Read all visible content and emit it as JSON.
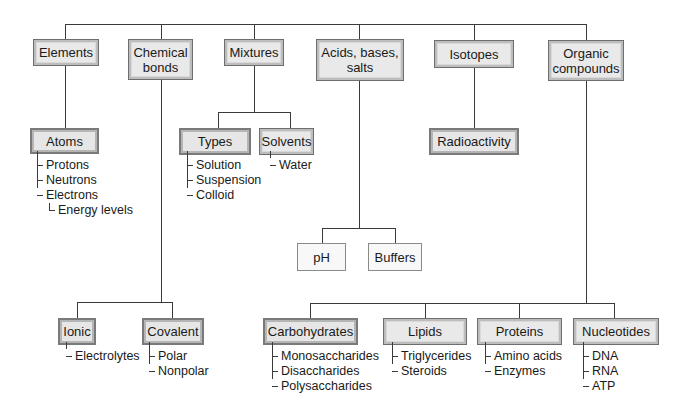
{
  "diagram": {
    "type": "concept-map",
    "top_level": [
      {
        "id": "elements",
        "label": "Elements"
      },
      {
        "id": "chemical_bonds",
        "label": "Chemical bonds"
      },
      {
        "id": "mixtures",
        "label": "Mixtures"
      },
      {
        "id": "acids_bases_salts",
        "label": "Acids, bases, salts"
      },
      {
        "id": "isotopes",
        "label": "Isotopes"
      },
      {
        "id": "organic_compounds",
        "label": "Organic compounds"
      }
    ],
    "nodes": {
      "elements": {
        "label": "Elements"
      },
      "chemical_bonds": {
        "label_line1": "Chemical",
        "label_line2": "bonds"
      },
      "mixtures": {
        "label": "Mixtures"
      },
      "acids_bases_salts": {
        "label_line1": "Acids, bases,",
        "label_line2": "salts"
      },
      "isotopes": {
        "label": "Isotopes"
      },
      "organic_compounds": {
        "label_line1": "Organic",
        "label_line2": "compounds"
      },
      "atoms": {
        "label": "Atoms",
        "items": [
          "Protons",
          "Neutrons",
          "Electrons"
        ],
        "sub_items": [
          "Energy levels"
        ]
      },
      "types": {
        "label": "Types",
        "items": [
          "Solution",
          "Suspension",
          "Colloid"
        ]
      },
      "solvents": {
        "label": "Solvents",
        "items": [
          "Water"
        ]
      },
      "radioactivity": {
        "label": "Radioactivity"
      },
      "ph": {
        "label": "pH"
      },
      "buffers": {
        "label": "Buffers"
      },
      "ionic": {
        "label": "Ionic",
        "items": [
          "Electrolytes"
        ]
      },
      "covalent": {
        "label": "Covalent",
        "items": [
          "Polar",
          "Nonpolar"
        ]
      },
      "carbohydrates": {
        "label": "Carbohydrates",
        "items": [
          "Monosaccharides",
          "Disaccharides",
          "Polysaccharides"
        ]
      },
      "lipids": {
        "label": "Lipids",
        "items": [
          "Triglycerides",
          "Steroids"
        ]
      },
      "proteins": {
        "label": "Proteins",
        "items": [
          "Amino acids",
          "Enzymes"
        ]
      },
      "nucleotides": {
        "label": "Nucleotides",
        "items": [
          "DNA",
          "RNA",
          "ATP"
        ]
      }
    },
    "edges": [
      [
        "elements",
        "atoms"
      ],
      [
        "chemical_bonds",
        "ionic"
      ],
      [
        "chemical_bonds",
        "covalent"
      ],
      [
        "mixtures",
        "types"
      ],
      [
        "mixtures",
        "solvents"
      ],
      [
        "acids_bases_salts",
        "ph"
      ],
      [
        "acids_bases_salts",
        "buffers"
      ],
      [
        "isotopes",
        "radioactivity"
      ],
      [
        "organic_compounds",
        "carbohydrates"
      ],
      [
        "organic_compounds",
        "lipids"
      ],
      [
        "organic_compounds",
        "proteins"
      ],
      [
        "organic_compounds",
        "nucleotides"
      ]
    ]
  },
  "colors": {
    "box_fill": "#e9e9e9",
    "box_border": "#6e6e6e",
    "line": "#3a3a3a",
    "background": "#ffffff"
  }
}
